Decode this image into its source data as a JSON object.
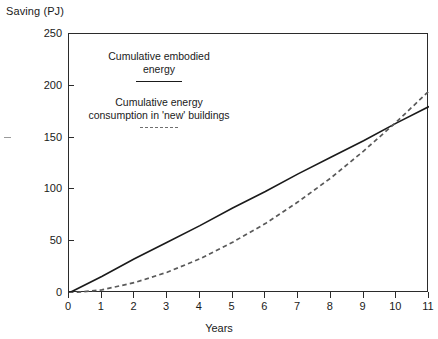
{
  "chart_data": {
    "type": "line",
    "title": "",
    "ylabel": "Saving (PJ)",
    "xlabel": "Years",
    "xlim": [
      0,
      11
    ],
    "ylim": [
      0,
      250
    ],
    "xticks": [
      0,
      1,
      2,
      3,
      4,
      5,
      6,
      7,
      8,
      9,
      10,
      11
    ],
    "yticks": [
      0,
      50,
      100,
      150,
      200,
      250
    ],
    "grid": false,
    "legend_position": "inside-upper-left",
    "series": [
      {
        "name": "Cumulative embodied energy",
        "style": "solid",
        "color": "#1a1a1a",
        "x": [
          0,
          1,
          2,
          3,
          4,
          5,
          6,
          7,
          8,
          9,
          10,
          11
        ],
        "values": [
          0,
          16,
          33,
          49,
          65,
          82,
          98,
          115,
          131,
          147,
          164,
          180
        ]
      },
      {
        "name": "Cumulative energy consumption in 'new' buildings",
        "style": "dashed",
        "color": "#555555",
        "x": [
          0,
          1,
          2,
          3,
          4,
          5,
          6,
          7,
          8,
          9,
          10,
          11
        ],
        "values": [
          0,
          3,
          10,
          20,
          33,
          49,
          67,
          88,
          111,
          137,
          165,
          195
        ]
      }
    ],
    "annotations": [
      "Curves intersect slightly after year 10 at about 168 PJ"
    ]
  },
  "legend": {
    "entries": [
      {
        "label": "Cumulative embodied\nenergy",
        "style": "solid"
      },
      {
        "label": "Cumulative energy\nconsumption in 'new' buildings",
        "style": "dashed"
      }
    ]
  },
  "axes": {
    "y_title": "Saving (PJ)",
    "x_title": "Years",
    "y_tick_labels": [
      "0",
      "50",
      "100",
      "150",
      "200",
      "250"
    ],
    "x_tick_labels": [
      "0",
      "1",
      "2",
      "3",
      "4",
      "5",
      "6",
      "7",
      "8",
      "9",
      "10",
      "11"
    ]
  }
}
